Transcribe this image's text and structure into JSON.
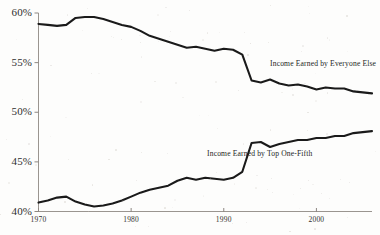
{
  "chart_data": {
    "type": "line",
    "title": "",
    "subtitle": "",
    "xlabel": "",
    "ylabel": "",
    "xlim": [
      1970,
      2006
    ],
    "ylim": [
      40,
      60
    ],
    "grid": false,
    "legend_position": "inline-annotations",
    "x_ticks": [
      1970,
      1980,
      1990,
      2000
    ],
    "x_tick_labels": [
      "1970",
      "1980",
      "1990",
      "2000"
    ],
    "y_ticks": [
      40,
      45,
      50,
      55,
      60
    ],
    "y_tick_labels": [
      "40%",
      "45%",
      "50%",
      "55%",
      "60%"
    ],
    "line_color": "#1a1a1a",
    "x": [
      1970,
      1971,
      1972,
      1973,
      1974,
      1975,
      1976,
      1977,
      1978,
      1979,
      1980,
      1981,
      1982,
      1983,
      1984,
      1985,
      1986,
      1987,
      1988,
      1989,
      1990,
      1991,
      1992,
      1993,
      1994,
      1995,
      1996,
      1997,
      1998,
      1999,
      2000,
      2001,
      2002,
      2003,
      2004,
      2005,
      2006
    ],
    "series": [
      {
        "name": "Income Earned by Everyone Else",
        "values": [
          58.9,
          58.8,
          58.7,
          58.8,
          59.5,
          59.6,
          59.6,
          59.4,
          59.1,
          58.8,
          58.6,
          58.2,
          57.7,
          57.4,
          57.1,
          56.8,
          56.5,
          56.6,
          56.4,
          56.2,
          56.4,
          56.3,
          55.8,
          53.2,
          53.0,
          53.3,
          52.9,
          52.7,
          52.8,
          52.6,
          52.3,
          52.5,
          52.4,
          52.4,
          52.1,
          52.0,
          51.9
        ]
      },
      {
        "name": "Income Earned by Top One-Fifth",
        "values": [
          40.9,
          41.1,
          41.4,
          41.5,
          41.0,
          40.7,
          40.5,
          40.6,
          40.8,
          41.1,
          41.5,
          41.9,
          42.2,
          42.4,
          42.6,
          43.1,
          43.4,
          43.2,
          43.4,
          43.3,
          43.2,
          43.4,
          44.0,
          46.9,
          47.0,
          46.5,
          46.8,
          47.0,
          47.2,
          47.2,
          47.4,
          47.4,
          47.6,
          47.6,
          47.9,
          48.0,
          48.1
        ]
      }
    ],
    "annotations": [
      {
        "text": "Income Earned by Everyone Else",
        "x_px": 270,
        "y_px": 60
      },
      {
        "text": "Income Earned by Top One-Fifth",
        "x_px": 207,
        "y_px": 150
      }
    ],
    "footnote": ""
  },
  "axis": {
    "y_labels": [
      "60%",
      "55%",
      "50%",
      "45%",
      "40%"
    ],
    "x_labels": [
      "1970",
      "1980",
      "1990",
      "2000"
    ]
  }
}
